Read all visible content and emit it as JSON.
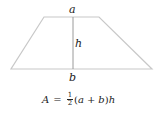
{
  "diagram": {
    "shape": "trapezoid",
    "labels": {
      "top_base": "a",
      "bottom_base": "b",
      "height": "h"
    },
    "colors": {
      "outline": "#c8c8c8",
      "height_line": "#9a9a9a",
      "text": "#222222"
    }
  },
  "formula": {
    "lhs": "A",
    "equals": "=",
    "frac_num": "1",
    "frac_den": "2",
    "open": "(",
    "a": "a",
    "plus": "+",
    "b": "b",
    "close": ")",
    "h": "h"
  }
}
